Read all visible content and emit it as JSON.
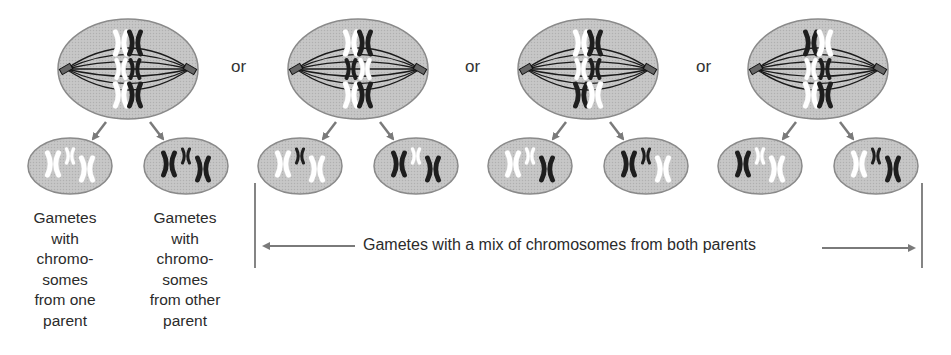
{
  "colors": {
    "cell_fill": "#c4c4c4",
    "cell_stroke": "#8a8a8a",
    "arrow": "#7a7a7a",
    "maternal": "#ffffff",
    "paternal": "#1e1e1e",
    "spindle": "#1a1a1a"
  },
  "separator_label": "or",
  "arrangements": [
    {
      "id": "a1",
      "rows": [
        [
          "white",
          "black"
        ],
        [
          "white",
          "black"
        ],
        [
          "white",
          "black"
        ]
      ],
      "gametes": [
        [
          "white",
          "white",
          "white"
        ],
        [
          "black",
          "black",
          "black"
        ]
      ]
    },
    {
      "id": "a2",
      "rows": [
        [
          "white",
          "black"
        ],
        [
          "black",
          "white"
        ],
        [
          "white",
          "black"
        ]
      ],
      "gametes": [
        [
          "white",
          "black",
          "white"
        ],
        [
          "black",
          "white",
          "black"
        ]
      ]
    },
    {
      "id": "a3",
      "rows": [
        [
          "white",
          "black"
        ],
        [
          "white",
          "black"
        ],
        [
          "black",
          "white"
        ]
      ],
      "gametes": [
        [
          "white",
          "white",
          "black"
        ],
        [
          "black",
          "black",
          "white"
        ]
      ]
    },
    {
      "id": "a4",
      "rows": [
        [
          "black",
          "white"
        ],
        [
          "white",
          "black"
        ],
        [
          "white",
          "black"
        ]
      ],
      "gametes": [
        [
          "black",
          "white",
          "white"
        ],
        [
          "white",
          "black",
          "black"
        ]
      ]
    }
  ],
  "captions": {
    "one_parent": [
      "Gametes",
      "with",
      "chromo-",
      "somes",
      "from one",
      "parent"
    ],
    "other_parent": [
      "Gametes",
      "with",
      "chromo-",
      "somes",
      "from other",
      "parent"
    ],
    "mix": "Gametes with a mix of chromosomes from both parents"
  }
}
